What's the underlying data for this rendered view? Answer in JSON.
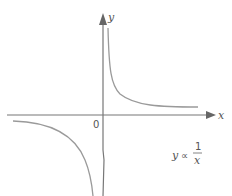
{
  "diagram": {
    "axes": {
      "x_label": "x",
      "y_label": "y",
      "origin_label": "0"
    },
    "relation": {
      "lhs": "y",
      "symbol": "∝",
      "numerator": "1",
      "denominator": "x"
    },
    "curves": [
      {
        "name": "first-quadrant-branch",
        "quadrant": 1
      },
      {
        "name": "third-quadrant-branch",
        "quadrant": 3
      }
    ],
    "colors": {
      "axis": "#777777",
      "curve": "#9a9a9a",
      "text": "#555555"
    }
  }
}
